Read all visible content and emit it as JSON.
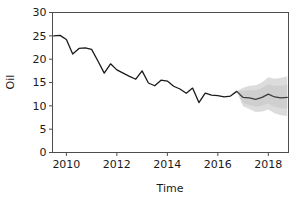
{
  "chart_data": {
    "type": "line",
    "title": "",
    "xlabel": "Time",
    "ylabel": "Oil",
    "xlim": [
      2009.45,
      2018.8
    ],
    "ylim": [
      0,
      30
    ],
    "xticks": [
      2010,
      2012,
      2014,
      2016,
      2018
    ],
    "xtick_labels": [
      "2010",
      "2012",
      "2014",
      "2016",
      "2018"
    ],
    "yticks": [
      0,
      5,
      10,
      15,
      20,
      25,
      30
    ],
    "ytick_labels": [
      "0",
      "5",
      "10",
      "15",
      "20",
      "25",
      "30"
    ],
    "grid": false,
    "legend": null,
    "colors": {
      "series_line": "#1a1a1a",
      "forecast_line": "#3d3d3d",
      "interval_80": "#cfcfcf",
      "interval_95": "#dcdcdc",
      "axis": "#4d4d4d",
      "background": "#ffffff"
    },
    "series": [
      {
        "name": "Oil (historical)",
        "kind": "observed",
        "x": [
          2009.5,
          2009.75,
          2010.0,
          2010.25,
          2010.5,
          2010.75,
          2011.0,
          2011.25,
          2011.5,
          2011.75,
          2012.0,
          2012.25,
          2012.5,
          2012.75,
          2013.0,
          2013.25,
          2013.5,
          2013.75,
          2014.0,
          2014.25,
          2014.5,
          2014.75,
          2015.0,
          2015.25,
          2015.5,
          2015.75,
          2016.0,
          2016.25,
          2016.5,
          2016.75
        ],
        "y": [
          25.0,
          25.1,
          24.2,
          21.1,
          22.3,
          22.4,
          22.1,
          19.6,
          17.0,
          19.0,
          17.7,
          17.0,
          16.3,
          15.7,
          17.5,
          14.9,
          14.3,
          15.5,
          15.3,
          14.2,
          13.6,
          12.7,
          13.8,
          10.7,
          12.7,
          12.3,
          12.2,
          11.9,
          12.1,
          13.1
        ]
      },
      {
        "name": "Oil (forecast)",
        "kind": "forecast",
        "x": [
          2016.75,
          2017.0,
          2017.25,
          2017.5,
          2017.75,
          2018.0,
          2018.25,
          2018.5,
          2018.75
        ],
        "y": [
          13.1,
          11.8,
          11.7,
          11.4,
          11.8,
          12.5,
          11.9,
          11.7,
          11.8
        ],
        "interval_80_lower": [
          13.1,
          10.6,
          10.2,
          9.8,
          10.0,
          10.5,
          9.8,
          9.5,
          9.4
        ],
        "interval_80_upper": [
          13.1,
          13.2,
          13.4,
          13.3,
          13.8,
          14.7,
          14.3,
          14.3,
          14.5
        ],
        "interval_95_lower": [
          13.1,
          9.9,
          9.3,
          8.7,
          8.8,
          9.2,
          8.4,
          8.0,
          7.8
        ],
        "interval_95_upper": [
          13.1,
          13.9,
          14.3,
          14.4,
          15.0,
          16.1,
          15.8,
          16.0,
          16.3
        ]
      }
    ]
  },
  "axes": {
    "x_axis_label": "Time",
    "y_axis_label": "Oil"
  }
}
